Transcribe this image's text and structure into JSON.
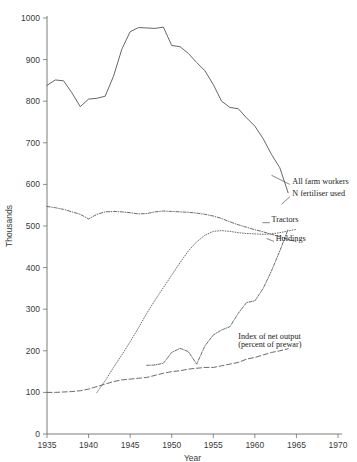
{
  "title": "Thousands",
  "chart_data": {
    "type": "line",
    "title": "",
    "xlabel": "Year",
    "ylabel": "Thousands",
    "xlim": [
      1935,
      1970
    ],
    "ylim": [
      0,
      1000
    ],
    "xticks": [
      1935,
      1940,
      1945,
      1950,
      1955,
      1960,
      1965,
      1970
    ],
    "yticks": [
      0,
      100,
      200,
      300,
      400,
      500,
      600,
      700,
      800,
      900,
      1000
    ],
    "grid": false,
    "legend_position": "inline-right",
    "series": [
      {
        "name": "All farm workers",
        "style": "solid",
        "label_x": 1964.5,
        "label_y": 600,
        "x": [
          1935,
          1936,
          1937,
          1938,
          1939,
          1940,
          1941,
          1942,
          1943,
          1944,
          1945,
          1946,
          1947,
          1948,
          1949,
          1950,
          1951,
          1952,
          1953,
          1954,
          1955,
          1956,
          1957,
          1958,
          1959,
          1960,
          1961,
          1962,
          1963,
          1964
        ],
        "y": [
          838,
          851,
          849,
          820,
          787,
          805,
          807,
          812,
          860,
          925,
          967,
          977,
          976,
          975,
          978,
          934,
          931,
          915,
          893,
          873,
          840,
          800,
          785,
          782,
          760,
          740,
          710,
          672,
          640,
          580
        ]
      },
      {
        "name": "N fertiliser used",
        "style": "dashdot-fine",
        "label_x": 1964.5,
        "label_y": 573,
        "x": [
          1947,
          1948,
          1949,
          1950,
          1951,
          1952,
          1953,
          1954,
          1955,
          1956,
          1957,
          1958,
          1959,
          1960,
          1961,
          1962,
          1963,
          1964
        ],
        "y": [
          165,
          166,
          170,
          196,
          206,
          198,
          168,
          212,
          238,
          250,
          258,
          290,
          316,
          320,
          350,
          392,
          440,
          492
        ]
      },
      {
        "name": "Tractors",
        "style": "dotted",
        "label_x": 1962,
        "label_y": 510,
        "x": [
          1941,
          1942,
          1943,
          1944,
          1945,
          1946,
          1947,
          1948,
          1949,
          1950,
          1951,
          1952,
          1953,
          1954,
          1955,
          1956,
          1957,
          1958,
          1959,
          1960,
          1961,
          1962,
          1963,
          1964,
          1965
        ],
        "y": [
          100,
          128,
          160,
          190,
          222,
          255,
          290,
          322,
          352,
          382,
          412,
          440,
          462,
          478,
          487,
          489,
          487,
          484,
          482,
          481,
          480,
          481,
          484,
          488,
          492
        ]
      },
      {
        "name": "Holdings",
        "style": "dashdot",
        "label_x": 1962.5,
        "label_y": 465,
        "x": [
          1935,
          1936,
          1937,
          1938,
          1939,
          1940,
          1941,
          1942,
          1943,
          1944,
          1945,
          1946,
          1947,
          1948,
          1949,
          1950,
          1951,
          1952,
          1953,
          1954,
          1955,
          1956,
          1957,
          1958,
          1959,
          1960,
          1961,
          1962,
          1963,
          1964,
          1965
        ],
        "y": [
          547,
          544,
          540,
          534,
          528,
          517,
          528,
          534,
          535,
          534,
          532,
          529,
          530,
          534,
          536,
          535,
          534,
          533,
          531,
          528,
          524,
          518,
          510,
          503,
          497,
          491,
          486,
          480,
          474,
          468,
          462
        ]
      },
      {
        "name": "Index of net output (percent of prewar)",
        "style": "dashed",
        "label_x": 1958,
        "label_y": 228,
        "label_line2_y": 208,
        "x": [
          1935,
          1936,
          1937,
          1938,
          1939,
          1940,
          1941,
          1942,
          1943,
          1944,
          1945,
          1946,
          1947,
          1948,
          1949,
          1950,
          1951,
          1952,
          1953,
          1954,
          1955,
          1956,
          1957,
          1958,
          1959,
          1960,
          1961,
          1962,
          1963,
          1964
        ],
        "y": [
          100,
          100,
          101,
          102,
          104,
          108,
          114,
          120,
          126,
          130,
          132,
          134,
          136,
          141,
          146,
          150,
          152,
          156,
          158,
          160,
          160,
          164,
          168,
          172,
          180,
          184,
          190,
          196,
          200,
          205
        ]
      }
    ],
    "series_labels": [
      {
        "text": "All farm workers"
      },
      {
        "text": "N fertiliser used"
      },
      {
        "text": "Tractors"
      },
      {
        "text": "Holdings"
      },
      {
        "text": "Index of net output"
      },
      {
        "text": "(percent of prewar)"
      }
    ]
  }
}
